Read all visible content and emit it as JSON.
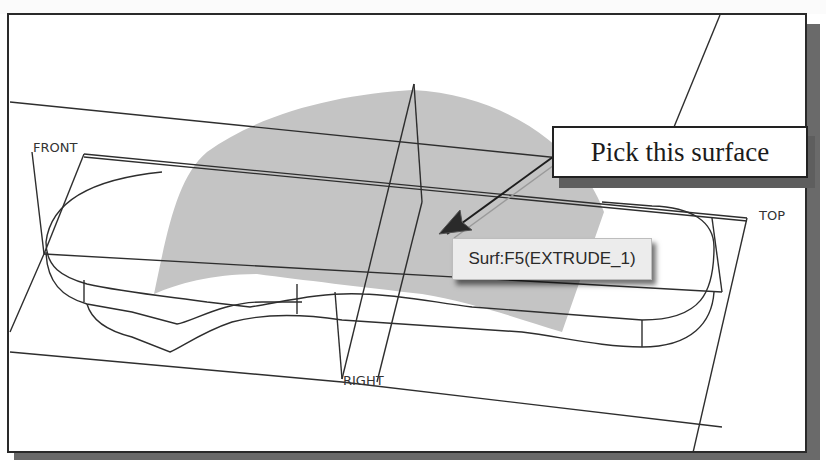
{
  "viewport": {
    "datum_planes": [
      {
        "label": "FRONT"
      },
      {
        "label": "TOP"
      },
      {
        "label": "RIGHT"
      }
    ],
    "surface_fill_color": "#c4c4c4",
    "edge_color": "#2e2e2e"
  },
  "callout": {
    "text": "Pick this surface"
  },
  "tooltip": {
    "text": "Surf:F5(EXTRUDE_1)"
  }
}
